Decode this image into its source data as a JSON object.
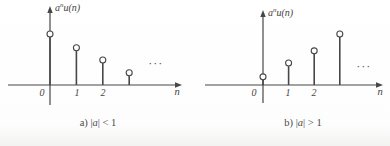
{
  "figure_title": "stem plots of a^n u(n)",
  "panels": [
    {
      "ylabel_base": "a",
      "ylabel_sup": "n",
      "ylabel_rest": "u(n)",
      "xlabel": "n",
      "ticks": [
        "0",
        "1",
        "2"
      ],
      "ellipsis": "···",
      "caption_prefix": "a) |",
      "caption_var": "a",
      "caption_suffix": "| < 1"
    },
    {
      "ylabel_base": "a",
      "ylabel_sup": "n",
      "ylabel_rest": "u(n)",
      "xlabel": "n",
      "ticks": [
        "0",
        "1",
        "2"
      ],
      "ellipsis": "···",
      "caption_prefix": "b) |",
      "caption_var": "a",
      "caption_suffix": "| > 1"
    }
  ],
  "chart_data": [
    {
      "type": "stem",
      "title": "a) |a| < 1",
      "ylabel": "a^n u(n)",
      "xlabel": "n",
      "x": [
        0,
        1,
        2,
        3
      ],
      "values": [
        1.0,
        0.73,
        0.49,
        0.24
      ],
      "marker": "open-circle",
      "annotation": "··· (sequence continues)",
      "xticks_labeled": [
        0,
        1,
        2
      ],
      "grid": false,
      "legend": "none"
    },
    {
      "type": "stem",
      "title": "b) |a| > 1",
      "ylabel": "a^n u(n)",
      "xlabel": "n",
      "x": [
        0,
        1,
        2,
        3
      ],
      "values": [
        0.16,
        0.43,
        0.67,
        1.0
      ],
      "marker": "open-circle",
      "annotation": "··· (sequence continues)",
      "xticks_labeled": [
        0,
        1,
        2
      ],
      "grid": false,
      "legend": "none"
    }
  ],
  "style": {
    "line_color": "#474747",
    "marker_fill": "#ffffff",
    "text_color": "#3e3e3e",
    "background": "#ffffff"
  }
}
